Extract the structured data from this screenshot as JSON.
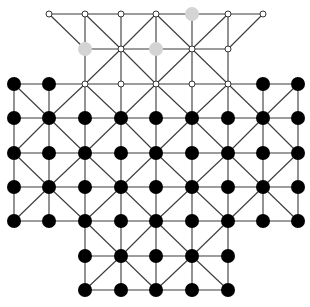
{
  "diagram": {
    "type": "board-game-position",
    "columns_x": [
      14,
      49,
      85,
      121,
      156,
      192,
      228,
      263,
      298
    ],
    "rows_y": [
      14,
      49,
      84,
      118,
      153,
      187,
      221,
      256,
      290
    ],
    "row_extents": [
      {
        "row": 0,
        "from": 1,
        "to": 7
      },
      {
        "row": 1,
        "from": 2,
        "to": 6
      },
      {
        "row": 2,
        "from": 0,
        "to": 8
      },
      {
        "row": 3,
        "from": 0,
        "to": 8
      },
      {
        "row": 4,
        "from": 0,
        "to": 8
      },
      {
        "row": 5,
        "from": 0,
        "to": 8
      },
      {
        "row": 6,
        "from": 0,
        "to": 8
      },
      {
        "row": 7,
        "from": 2,
        "to": 6
      },
      {
        "row": 8,
        "from": 2,
        "to": 6
      }
    ],
    "colors": {
      "line": "#3a3a3a",
      "black_piece": "#000000",
      "grey_piece": "#d4d4d4",
      "empty_point_fill": "#ffffff",
      "empty_point_stroke": "#333333"
    },
    "points": [
      [
        "W",
        "W",
        "W",
        "W",
        "G",
        "W",
        "W"
      ],
      [
        "G",
        "W",
        "G",
        "W",
        "W"
      ],
      [
        "B",
        "B",
        "W",
        "W",
        "W",
        "W",
        "W",
        "B",
        "B"
      ],
      [
        "B",
        "B",
        "B",
        "B",
        "B",
        "B",
        "B",
        "B",
        "B"
      ],
      [
        "B",
        "B",
        "B",
        "B",
        "B",
        "B",
        "B",
        "B",
        "B"
      ],
      [
        "B",
        "B",
        "B",
        "B",
        "B",
        "B",
        "B",
        "B",
        "B"
      ],
      [
        "B",
        "B",
        "B",
        "B",
        "B",
        "B",
        "B",
        "B",
        "B"
      ],
      [
        "B",
        "B",
        "B",
        "B",
        "B"
      ],
      [
        "B",
        "B",
        "B",
        "B",
        "B"
      ]
    ],
    "legend": {
      "B": "black piece",
      "G": "grey piece",
      "W": "empty point"
    }
  }
}
